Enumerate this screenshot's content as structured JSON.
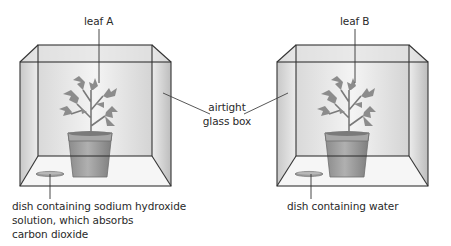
{
  "diagram": {
    "experiments": [
      {
        "id": "A",
        "leaf_label": "leaf A",
        "dish_label_lines": [
          "dish containing sodium hydroxide",
          "solution, which absorbs",
          "carbon dioxide"
        ]
      },
      {
        "id": "B",
        "leaf_label": "leaf B",
        "dish_label_lines": [
          "dish containing water"
        ]
      }
    ],
    "shared_label_lines": [
      "airtight",
      "glass box"
    ],
    "colors": {
      "outline": "#333333",
      "glass": "#e8e8e8",
      "plant": "#8a8a8a",
      "pot": "#9c9c9c",
      "text": "#2a2a2a"
    }
  }
}
